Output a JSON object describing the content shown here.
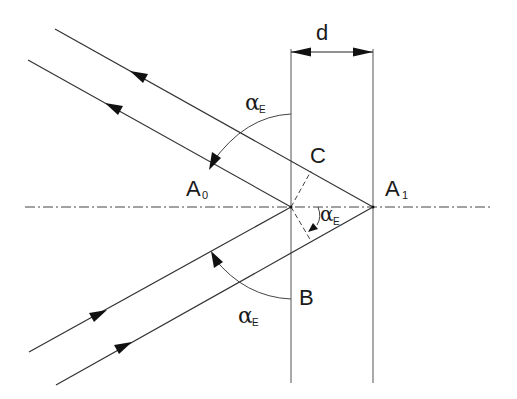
{
  "diagram": {
    "labels": {
      "thickness": "d",
      "point_c": "C",
      "point_b": "B",
      "point_a0": "A",
      "point_a0_sub": "0",
      "point_a1": "A",
      "point_a1_sub": "1",
      "angle_symbol": "α",
      "angle_sub": "E"
    },
    "colors": {
      "line": "#3a3a3a",
      "text": "#1a1a1a",
      "background": "#ffffff"
    }
  }
}
